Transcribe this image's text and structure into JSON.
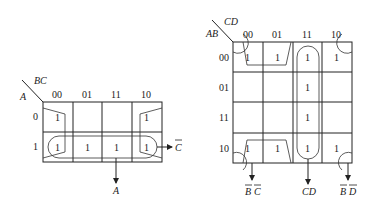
{
  "maps": [
    {
      "id": "kmap-3var",
      "row_var": "A",
      "col_var": "BC",
      "col_headers": [
        "00",
        "01",
        "11",
        "10"
      ],
      "row_headers": [
        "0",
        "1"
      ],
      "cells": [
        [
          "1",
          "",
          "",
          "1"
        ],
        [
          "1",
          "1",
          "1",
          "1"
        ]
      ],
      "groups": [
        {
          "term": "A",
          "label": "A"
        },
        {
          "term": "C'",
          "label": "C",
          "overbar": true
        }
      ]
    },
    {
      "id": "kmap-4var",
      "row_var": "AB",
      "col_var": "CD",
      "col_headers": [
        "00",
        "01",
        "11",
        "10"
      ],
      "row_headers": [
        "00",
        "01",
        "11",
        "10"
      ],
      "cells": [
        [
          "1",
          "1",
          "1",
          "1"
        ],
        [
          "",
          "",
          "1",
          ""
        ],
        [
          "",
          "",
          "1",
          ""
        ],
        [
          "1",
          "1",
          "1",
          "1"
        ]
      ],
      "groups": [
        {
          "term": "B'C'",
          "label_1": "B",
          "label_2": "C",
          "overbar": true
        },
        {
          "term": "CD",
          "label": "CD"
        },
        {
          "term": "B'D'",
          "label_1": "B",
          "label_2": "D",
          "overbar": true
        }
      ]
    }
  ]
}
